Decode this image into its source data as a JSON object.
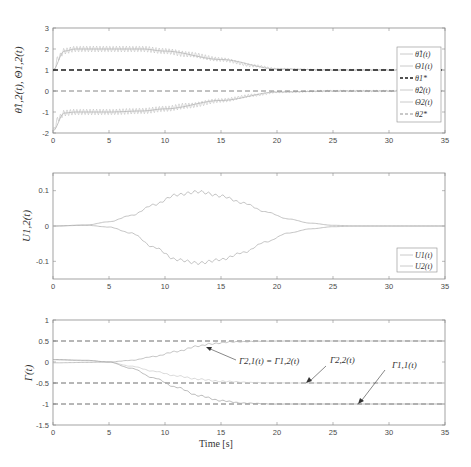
{
  "chart_data": [
    {
      "type": "line",
      "title": "",
      "xlabel": "",
      "ylabel": "θ̂1,2(t), Θ1,2(t)",
      "xlim": [
        0,
        35
      ],
      "ylim": [
        -2,
        3
      ],
      "xticks": [
        0,
        5,
        10,
        15,
        20,
        25,
        30,
        35
      ],
      "yticks": [
        -2,
        -1,
        0,
        1,
        2,
        3
      ],
      "grid": false,
      "legend_position": "east-inside",
      "legend": [
        "θ̂1(t)",
        "Θ1(t)",
        "θ1*",
        "θ̂2(t)",
        "Θ2(t)",
        "θ2*"
      ],
      "series": [
        {
          "name": "θ̂1(t)",
          "style": "gray oscillating",
          "x": [
            0,
            0.5,
            1,
            2,
            5,
            8,
            10,
            12,
            15,
            18,
            20,
            25,
            30,
            35
          ],
          "y": [
            0.9,
            1.6,
            1.9,
            2.0,
            2.0,
            2.0,
            1.9,
            1.75,
            1.5,
            1.2,
            1.05,
            1.0,
            1.0,
            1.0
          ]
        },
        {
          "name": "Θ1(t)",
          "style": "gray",
          "x": [
            0,
            1,
            2,
            5,
            8,
            10,
            15,
            20,
            25,
            35
          ],
          "y": [
            1.0,
            1.9,
            2.0,
            2.0,
            2.0,
            1.9,
            1.5,
            1.05,
            1.0,
            1.0
          ]
        },
        {
          "name": "θ1*",
          "style": "black dashed",
          "x": [
            0,
            35
          ],
          "y": [
            1,
            1
          ]
        },
        {
          "name": "θ̂2(t)",
          "style": "gray oscillating",
          "x": [
            0,
            0.5,
            1,
            2,
            5,
            8,
            10,
            12,
            15,
            18,
            20,
            25,
            30,
            35
          ],
          "y": [
            -1.9,
            -1.3,
            -1.05,
            -1.0,
            -1.0,
            -0.95,
            -0.85,
            -0.7,
            -0.45,
            -0.2,
            -0.05,
            0,
            0,
            0
          ]
        },
        {
          "name": "Θ2(t)",
          "style": "gray",
          "x": [
            0,
            1,
            2,
            5,
            8,
            10,
            15,
            20,
            25,
            35
          ],
          "y": [
            -1.9,
            -1.05,
            -1.0,
            -1.0,
            -0.95,
            -0.85,
            -0.45,
            -0.05,
            0,
            0
          ]
        },
        {
          "name": "θ2*",
          "style": "gray dashed",
          "x": [
            0,
            35
          ],
          "y": [
            0,
            0
          ]
        }
      ]
    },
    {
      "type": "line",
      "title": "",
      "xlabel": "",
      "ylabel": "U1,2(t)",
      "xlim": [
        0,
        35
      ],
      "ylim": [
        -0.15,
        0.15
      ],
      "xticks": [
        0,
        5,
        10,
        15,
        20,
        25,
        30,
        35
      ],
      "yticks": [
        -0.1,
        0,
        0.1
      ],
      "grid": false,
      "legend_position": "southeast",
      "legend": [
        "U1(t)",
        "U2(t)"
      ],
      "series": [
        {
          "name": "U1(t)",
          "x": [
            0,
            3,
            5,
            7,
            9,
            11,
            13,
            15,
            17,
            19,
            21,
            23,
            25,
            27,
            35
          ],
          "y": [
            0,
            0.003,
            0.012,
            0.03,
            0.06,
            0.088,
            0.097,
            0.085,
            0.065,
            0.04,
            0.02,
            0.008,
            0.002,
            0,
            0
          ]
        },
        {
          "name": "U2(t)",
          "x": [
            0,
            3,
            5,
            7,
            9,
            11,
            13,
            15,
            17,
            19,
            21,
            23,
            25,
            27,
            35
          ],
          "y": [
            0,
            0.002,
            -0.003,
            -0.02,
            -0.06,
            -0.095,
            -0.105,
            -0.095,
            -0.075,
            -0.045,
            -0.02,
            -0.008,
            -0.002,
            0,
            0
          ]
        }
      ]
    },
    {
      "type": "line",
      "title": "",
      "xlabel": "Time [s]",
      "ylabel": "Γ(t)",
      "xlim": [
        0,
        35
      ],
      "ylim": [
        -1.5,
        1
      ],
      "xticks": [
        0,
        5,
        10,
        15,
        20,
        25,
        30,
        35
      ],
      "yticks": [
        -1.5,
        -1,
        -0.5,
        0,
        0.5,
        1
      ],
      "grid": false,
      "reference_lines": [
        0.5,
        -0.5,
        -1
      ],
      "annotations": [
        {
          "text": "Γ2,1(t) = Γ1,2(t)",
          "points_to": [
            13.8,
            0.38
          ]
        },
        {
          "text": "Γ2,2(t)",
          "points_to": [
            23.0,
            -0.5
          ]
        },
        {
          "text": "Γ1,1(t)",
          "points_to": [
            27.3,
            -1.0
          ]
        }
      ],
      "series": [
        {
          "name": "Γ2,1(t) = Γ1,2(t)",
          "x": [
            0,
            3,
            5,
            7,
            9,
            11,
            13,
            14,
            16,
            20,
            35
          ],
          "y": [
            -0.02,
            -0.01,
            0.0,
            0.04,
            0.13,
            0.25,
            0.38,
            0.43,
            0.48,
            0.5,
            0.5
          ]
        },
        {
          "name": "Γ2,2(t)",
          "x": [
            0,
            3,
            5,
            7,
            9,
            11,
            13,
            15,
            18,
            22,
            35
          ],
          "y": [
            0.05,
            0.03,
            0.0,
            -0.1,
            -0.22,
            -0.33,
            -0.41,
            -0.46,
            -0.49,
            -0.5,
            -0.5
          ]
        },
        {
          "name": "Γ1,1(t)",
          "x": [
            0,
            3,
            5,
            7,
            9,
            11,
            13,
            15,
            17,
            20,
            35
          ],
          "y": [
            0.06,
            0.04,
            0.0,
            -0.15,
            -0.38,
            -0.6,
            -0.8,
            -0.92,
            -0.98,
            -1.0,
            -1.0
          ]
        }
      ]
    }
  ],
  "panels": {
    "top": {
      "ylabel": "θ̂1,2(t), Θ1,2(t)",
      "yticks": [
        "3",
        "2",
        "1",
        "0",
        "-1",
        "-2"
      ],
      "xticks": [
        "0",
        "5",
        "10",
        "15",
        "20",
        "25",
        "30",
        "35"
      ],
      "legend": [
        {
          "label": "θ̂1(t)",
          "style": "solid-light"
        },
        {
          "label": "Θ1(t)",
          "style": "solid-light"
        },
        {
          "label": "θ1*",
          "style": "dashed-black"
        },
        {
          "label": "θ̂2(t)",
          "style": "solid-light"
        },
        {
          "label": "Θ2(t)",
          "style": "solid-light"
        },
        {
          "label": "θ2*",
          "style": "dashed-gray"
        }
      ]
    },
    "middle": {
      "ylabel": "U1,2(t)",
      "yticks": [
        "0.1",
        "0",
        "-0.1"
      ],
      "xticks": [
        "0",
        "5",
        "10",
        "15",
        "20",
        "25",
        "30",
        "35"
      ],
      "legend": [
        {
          "label": "U1(t)"
        },
        {
          "label": "U2(t)"
        }
      ]
    },
    "bottom": {
      "ylabel": "Γ(t)",
      "xlabel": "Time [s]",
      "yticks": [
        "1",
        "0.5",
        "0",
        "-0.5",
        "-1",
        "-1.5"
      ],
      "xticks": [
        "0",
        "5",
        "10",
        "15",
        "20",
        "25",
        "30",
        "35"
      ],
      "annotations": [
        "Γ2,1(t) = Γ1,2(t)",
        "Γ2,2(t)",
        "Γ1,1(t)"
      ]
    }
  },
  "colors": {
    "axis": "#8c8c8c",
    "curve_light": "#b4b4b4",
    "curve_mid": "#9a9a9a",
    "ref_black": "#1a1a1a",
    "ref_gray": "#777777",
    "arrow": "#555555"
  }
}
